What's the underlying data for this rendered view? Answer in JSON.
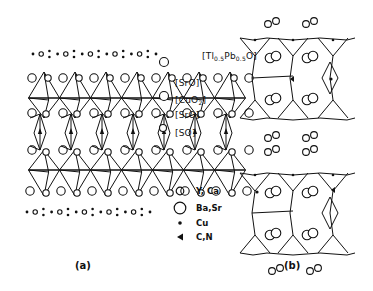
{
  "figure": {
    "panels": [
      {
        "id": "a",
        "label": "(a)"
      },
      {
        "id": "b",
        "label": "(b)"
      }
    ],
    "layer_labels": [
      {
        "prefix": "[Tl",
        "sub1": "0.5",
        "mid": "Pb",
        "sub2": "0.5",
        "suffix": "O]"
      },
      {
        "text": "[SrO]"
      },
      {
        "prefix": "[CuO",
        "sub1": "2",
        "suffix": "]"
      },
      {
        "text": "[SrO]"
      },
      {
        "text": "[SO]"
      }
    ],
    "legend": [
      {
        "symbol": "small-circle",
        "label": "Y, Ca"
      },
      {
        "symbol": "large-circle",
        "label": "Ba,Sr"
      },
      {
        "symbol": "dot",
        "label": "Cu"
      },
      {
        "symbol": "triangle",
        "label": "C,N"
      }
    ]
  }
}
